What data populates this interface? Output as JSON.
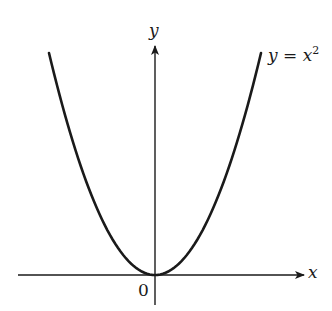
{
  "chart_data": {
    "type": "line",
    "title": "",
    "xlabel": "x",
    "ylabel": "y",
    "origin_label": "0",
    "series": [
      {
        "name": "y = x^2",
        "label_text": "y = x",
        "label_exponent": "2",
        "x": [
          -1.0,
          -0.75,
          -0.5,
          -0.25,
          0,
          0.25,
          0.5,
          0.75,
          1.0
        ],
        "values": [
          1.0,
          0.5625,
          0.25,
          0.0625,
          0,
          0.0625,
          0.25,
          0.5625,
          1.0
        ]
      }
    ],
    "grid": false,
    "legend": "inline label at upper right of curve",
    "axes": {
      "x_arrow": true,
      "y_arrow": true,
      "ticks": []
    },
    "colors": {
      "curve": "#1a1a1a",
      "axes": "#1a1a1a",
      "background": "#ffffff"
    }
  }
}
